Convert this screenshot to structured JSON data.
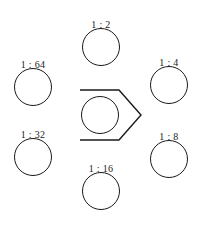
{
  "diagram": {
    "type": "ratio-circles-diagram",
    "stroke_color": "#1a1a1a",
    "background_color": "#ffffff",
    "center_node": {
      "name": "center-circle",
      "label": "",
      "cx": 100,
      "cy": 115,
      "r": 19
    },
    "nodes": [
      {
        "id": "ratio-1-2",
        "label": "1 : 2",
        "position": "top",
        "cx": 101,
        "cy": 47,
        "r": 19,
        "label_x": 101,
        "label_y": 19
      },
      {
        "id": "ratio-1-4",
        "label": "1 : 4",
        "position": "right-top",
        "cx": 169,
        "cy": 85,
        "r": 19,
        "label_x": 169,
        "label_y": 57
      },
      {
        "id": "ratio-1-8",
        "label": "1 : 8",
        "position": "right-bottom",
        "cx": 169,
        "cy": 159,
        "r": 19,
        "label_x": 169,
        "label_y": 131
      },
      {
        "id": "ratio-1-16",
        "label": "1 : 16",
        "position": "bottom",
        "cx": 101,
        "cy": 191,
        "r": 19,
        "label_x": 101,
        "label_y": 163
      },
      {
        "id": "ratio-1-32",
        "label": "1 : 32",
        "position": "left-bottom",
        "cx": 33,
        "cy": 157,
        "r": 19,
        "label_x": 33,
        "label_y": 129
      },
      {
        "id": "ratio-1-64",
        "label": "1 : 64",
        "position": "left-top",
        "cx": 33,
        "cy": 87,
        "r": 19,
        "label_x": 33,
        "label_y": 59
      }
    ],
    "chevron": {
      "name": "right-pointing-chevron",
      "points": "80,90 119,90 141,115 119,140 80,140",
      "stroke_width": 1.4
    }
  }
}
